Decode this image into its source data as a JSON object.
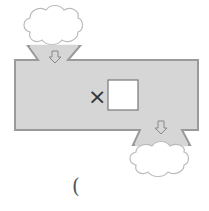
{
  "diagram": {
    "type": "function-machine",
    "operator": "×",
    "operand_box": "",
    "input_cloud": "",
    "output_cloud": "",
    "answer_paren": "(",
    "colors": {
      "machine_fill": "#d6d6d6",
      "machine_border": "#9a9a9a",
      "cloud_stroke": "#bbbbbb",
      "box_fill": "#ffffff",
      "box_border": "#777777"
    }
  }
}
